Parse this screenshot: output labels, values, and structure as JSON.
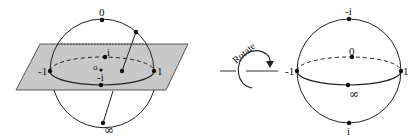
{
  "figure": {
    "left": {
      "labels": {
        "top": "0",
        "i": "i",
        "neg_one": "-1",
        "one": "1",
        "neg_i": "-i",
        "origin": "o",
        "bottom": "∞"
      },
      "plane_color": "#c8c8c8"
    },
    "rotate": {
      "label": "Rotate"
    },
    "right": {
      "labels": {
        "top": "-i",
        "center": "0",
        "neg_one": "-1",
        "one": "1",
        "front": "∞",
        "bottom": "i"
      }
    }
  }
}
